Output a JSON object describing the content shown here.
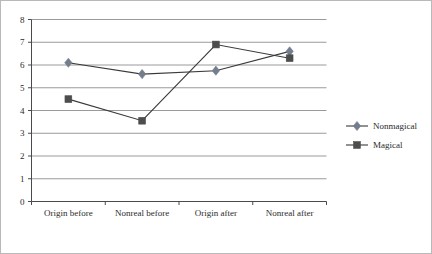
{
  "chart_data": {
    "type": "line",
    "title": "",
    "xlabel": "",
    "ylabel": "",
    "categories": [
      "Origin before",
      "Nonreal before",
      "Origin after",
      "Nonreal after"
    ],
    "series": [
      {
        "name": "Nonmagical",
        "marker": "diamond",
        "color": "#737d8c",
        "values": [
          6.1,
          5.6,
          5.75,
          6.6
        ]
      },
      {
        "name": "Magical",
        "marker": "square",
        "color": "#4d4d4d",
        "values": [
          4.5,
          3.55,
          6.9,
          6.3
        ]
      }
    ],
    "ylim": [
      0,
      8
    ],
    "yticks": [
      0,
      1,
      2,
      3,
      4,
      5,
      6,
      7,
      8
    ],
    "ytick_labels": [
      "0",
      "1",
      "2",
      "3",
      "4",
      "5",
      "6",
      "7",
      "8"
    ],
    "grid": true,
    "grid_axis": "y",
    "legend_position": "right",
    "line_color": "#3a3a3a",
    "grid_color": "#8f8f8f",
    "axis_color": "#4a4a4a",
    "border_color": "#b9b9b9",
    "background": "#ffffff"
  },
  "axis": {
    "y_tick_labels": [
      "8",
      "7",
      "6",
      "5",
      "4",
      "3",
      "2",
      "1",
      "0"
    ],
    "x_category_labels": [
      "Origin before",
      "Nonreal before",
      "Origin after",
      "Nonreal after"
    ]
  },
  "legend": {
    "entries": [
      {
        "label": "Nonmagical",
        "marker": "diamond",
        "color": "#737d8c"
      },
      {
        "label": "Magical",
        "marker": "square",
        "color": "#4d4d4d"
      }
    ]
  }
}
